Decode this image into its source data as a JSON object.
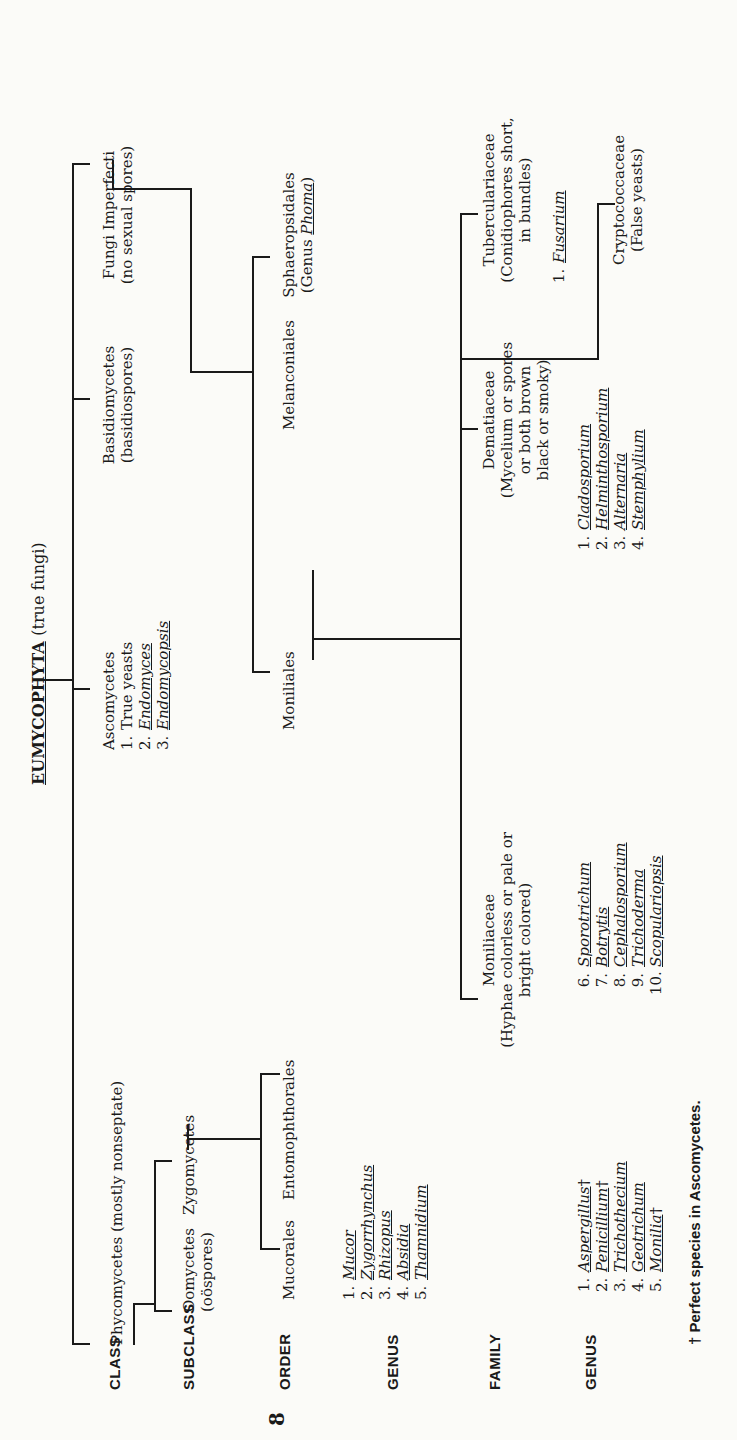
{
  "title": {
    "name": "EUMYCOPHYTA",
    "note": "(true fungi)"
  },
  "ranks": [
    "CLASS",
    "SUBCLASS",
    "ORDER",
    "GENUS",
    "FAMILY",
    "GENUS"
  ],
  "classes": {
    "phycomycetes": "Phycomycetes (mostly nonseptate)",
    "ascomycetes": {
      "label": "Ascomycetes",
      "items": [
        {
          "n": "1.",
          "name": "True yeasts",
          "italic": false
        },
        {
          "n": "2.",
          "name": "Endomyces",
          "italic": true
        },
        {
          "n": "3.",
          "name": "Endomycopsis",
          "italic": true
        }
      ]
    },
    "basidiomycetes": {
      "label": "Basidiomycetes",
      "note": "(basidiospores)"
    },
    "fungi_imperfecti": {
      "label": "Fungi Imperfecti",
      "note": "(no sexual spores)"
    }
  },
  "subclasses": {
    "oomycetes": {
      "label": "Oomycetes",
      "note": "(oöspores)"
    },
    "zygomycetes": "Zygomycetes"
  },
  "orders": {
    "mucorales": "Mucorales",
    "entomophthorales": "Entomophthorales",
    "moniliales": "Moniliales",
    "melanconiales": "Melanconiales",
    "sphaeropsidales": {
      "label": "Sphaeropsidales",
      "note_prefix": "(Genus ",
      "genus": "Phoma",
      "note_suffix": ")"
    }
  },
  "mucorales_genera": [
    {
      "n": "1.",
      "name": "Mucor"
    },
    {
      "n": "2.",
      "name": "Zygorrhynchus"
    },
    {
      "n": "3.",
      "name": "Rhizopus"
    },
    {
      "n": "4.",
      "name": "Absidia"
    },
    {
      "n": "5.",
      "name": "Thamnidium"
    }
  ],
  "families": {
    "moniliaceae": {
      "label": "Moniliaceae",
      "desc1": "(Hyphae colorless or pale or",
      "desc2": "bright colored)"
    },
    "dematiaceae": {
      "label": "Dematiaceae",
      "desc1": "(Mycelium or spores",
      "desc2": "or both brown",
      "desc3": "black or smoky)"
    },
    "tuberculariaceae": {
      "label": "Tuberculariaceae",
      "desc1": "(Conidiophores short,",
      "desc2": "in bundles)"
    },
    "cryptococcaceae": {
      "label": "Cryptococcaceae",
      "desc1": "(False yeasts)"
    }
  },
  "moniliaceae_genera_a": [
    {
      "n": "1.",
      "name": "Aspergillus",
      "dagger": "†"
    },
    {
      "n": "2.",
      "name": "Penicillium",
      "dagger": "†"
    },
    {
      "n": "3.",
      "name": "Trichothecium",
      "dagger": ""
    },
    {
      "n": "4.",
      "name": "Geotrichum",
      "dagger": ""
    },
    {
      "n": "5.",
      "name": "Monilia",
      "dagger": "†"
    }
  ],
  "moniliaceae_genera_b": [
    {
      "n": "6.",
      "name": "Sporotrichum"
    },
    {
      "n": "7.",
      "name": "Botrytis"
    },
    {
      "n": "8.",
      "name": "Cephalosporium"
    },
    {
      "n": "9.",
      "name": "Trichoderma"
    },
    {
      "n": "10.",
      "name": "Scopulariopsis"
    }
  ],
  "dematiaceae_genera": [
    {
      "n": "1.",
      "name": "Cladosporium"
    },
    {
      "n": "2.",
      "name": "Helminthosporium"
    },
    {
      "n": "3.",
      "name": "Alternaria"
    },
    {
      "n": "4.",
      "name": "Stemphylium"
    }
  ],
  "tuberculariaceae_genera": [
    {
      "n": "1.",
      "name": "Fusarium"
    }
  ],
  "footnote": "† Perfect species in Ascomycetes.",
  "page_number": "8"
}
